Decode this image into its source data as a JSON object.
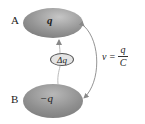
{
  "diagram": {
    "conductor_a": {
      "label": "A",
      "charge": "q",
      "color": "#8a8a8a"
    },
    "conductor_b": {
      "label": "B",
      "charge": "−q",
      "color": "#8a8a8a"
    },
    "transfer": {
      "label": "Δq"
    },
    "equation": {
      "lhs": "v",
      "equals": "=",
      "numerator": "q",
      "denominator": "C"
    },
    "colors": {
      "ellipse_fill": "#8a8a8a",
      "ellipse_highlight": "#c8c8c8",
      "arrow": "#888888"
    }
  }
}
